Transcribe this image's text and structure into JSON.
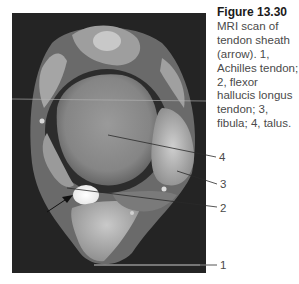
{
  "figure": {
    "title": "Figure 13.30",
    "caption": "MRI scan of tendon sheath (arrow). 1, Achilles tendon; 2, flexor hallucis longus tendon; 3, fibula; 4, talus.",
    "caption_lines": [
      "MRI scan of",
      "tendon sheath",
      "(arrow). 1,",
      "Achilles tendon;",
      "2, flexor",
      "hallucis longus",
      "tendon; 3,",
      "fibula; 4, talus."
    ],
    "image_alt": "MRI scan of ankle showing tendon sheath",
    "labels": [
      {
        "number": "4",
        "structure": "talus"
      },
      {
        "number": "3",
        "structure": "fibula"
      },
      {
        "number": "2",
        "structure": "flexor hallucis longus tendon"
      },
      {
        "number": "1",
        "structure": "Achilles tendon"
      }
    ]
  }
}
